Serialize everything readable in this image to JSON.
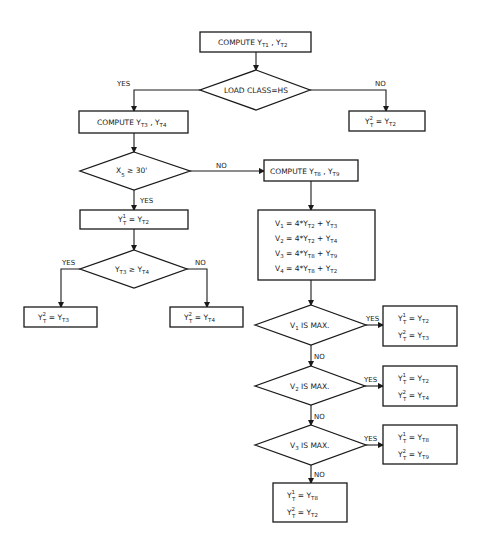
{
  "diagram": {
    "type": "flowchart",
    "nodes": {
      "compute_t1_t2": {
        "text": "COMPUTE Y",
        "sub1": "T1",
        "mid": " , Y",
        "sub2": "T2"
      },
      "load_class": {
        "text": "LOAD CLASS=HS"
      },
      "no_hs_result": {
        "lhs": "Y",
        "lhs_sup": "2",
        "lhs_sub": "T",
        "eq": " = Y",
        "rhs_sub": "T2"
      },
      "compute_t3_t4": {
        "text": "COMPUTE Y",
        "sub1": "T3",
        "mid": " , Y",
        "sub2": "T4"
      },
      "x5_check": {
        "text": "X",
        "sub": "5",
        "op": " ≥ ",
        "val": "30'"
      },
      "yes_x5_result": {
        "lhs": "Y",
        "lhs_sup": "1",
        "lhs_sub": "T",
        "eq": " = Y",
        "rhs_sub": "T2"
      },
      "t3_ge_t4": {
        "a": "Y",
        "a_sub": "T3",
        "op": " ≥ ",
        "b": "Y",
        "b_sub": "T4"
      },
      "t3_yes_result": {
        "lhs": "Y",
        "lhs_sup": "2",
        "lhs_sub": "T",
        "eq": " = Y",
        "rhs_sub": "T3"
      },
      "t3_no_result": {
        "lhs": "Y",
        "lhs_sup": "2",
        "lhs_sub": "T",
        "eq": " = Y",
        "rhs_sub": "T4"
      },
      "compute_t8_t9": {
        "text": "COMPUTE Y",
        "sub1": "T8",
        "mid": " , Y",
        "sub2": "T9"
      },
      "v_block": {
        "lines": [
          {
            "v": "V",
            "v_sub": "1",
            "expr": " = 4*Y",
            "s1": "T2",
            "plus": " + Y",
            "s2": "T3"
          },
          {
            "v": "V",
            "v_sub": "2",
            "expr": " = 4*Y",
            "s1": "T2",
            "plus": " + Y",
            "s2": "T4"
          },
          {
            "v": "V",
            "v_sub": "3",
            "expr": " = 4*Y",
            "s1": "T8",
            "plus": " + Y",
            "s2": "T9"
          },
          {
            "v": "V",
            "v_sub": "4",
            "expr": " = 4*Y",
            "s1": "T8",
            "plus": " + Y",
            "s2": "T2"
          }
        ]
      },
      "v1_max": {
        "v": "V",
        "v_sub": "1",
        "text": " IS MAX."
      },
      "v1_result": {
        "l1_sup": "1",
        "l1_rhs": "T2",
        "l2_sup": "2",
        "l2_rhs": "T3"
      },
      "v2_max": {
        "v": "V",
        "v_sub": "2",
        "text": " IS MAX."
      },
      "v2_result": {
        "l1_sup": "1",
        "l1_rhs": "T2",
        "l2_sup": "2",
        "l2_rhs": "T4"
      },
      "v3_max": {
        "v": "V",
        "v_sub": "3",
        "text": " IS MAX."
      },
      "v3_result": {
        "l1_sup": "1",
        "l1_rhs": "T8",
        "l2_sup": "2",
        "l2_rhs": "T9"
      },
      "final_result": {
        "l1_sup": "1",
        "l1_rhs": "T8",
        "l2_sup": "2",
        "l2_rhs": "T2"
      }
    },
    "edge_labels": {
      "yes": "YES",
      "no": "NO"
    },
    "common": {
      "Y": "Y",
      "T": "T",
      "eq": " = Y"
    }
  }
}
